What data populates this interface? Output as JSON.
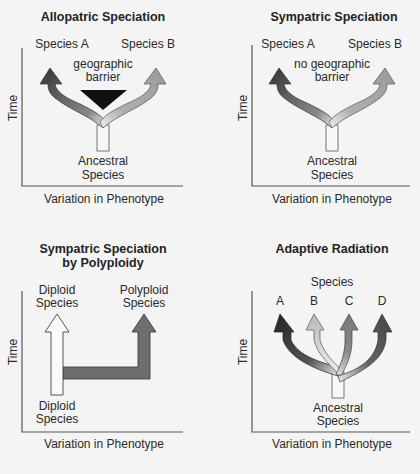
{
  "panels": {
    "allopatric": {
      "title": "Allopatric Speciation",
      "species_a": "Species A",
      "species_b": "Species B",
      "barrier_line1": "geographic",
      "barrier_line2": "barrier",
      "ancestral_line1": "Ancestral",
      "ancestral_line2": "Species",
      "y_axis": "Time",
      "x_axis": "Variation in Phenotype"
    },
    "sympatric": {
      "title": "Sympatric Speciation",
      "species_a": "Species A",
      "species_b": "Species B",
      "barrier_line1": "no geographic",
      "barrier_line2": "barrier",
      "ancestral_line1": "Ancestral",
      "ancestral_line2": "Species",
      "y_axis": "Time",
      "x_axis": "Variation in Phenotype"
    },
    "polyploidy": {
      "title_line1": "Sympatric Speciation",
      "title_line2": "by Polyploidy",
      "top_left_line1": "Diploid",
      "top_left_line2": "Species",
      "top_right_line1": "Polyploid",
      "top_right_line2": "Species",
      "bottom_line1": "Diploid",
      "bottom_line2": "Species",
      "y_axis": "Time",
      "x_axis": "Variation in Phenotype"
    },
    "adaptive": {
      "title": "Adaptive Radiation",
      "species_header": "Species",
      "species_labels": [
        "A",
        "B",
        "C",
        "D"
      ],
      "ancestral_line1": "Ancestral",
      "ancestral_line2": "Species",
      "y_axis": "Time",
      "x_axis": "Variation in Phenotype"
    }
  },
  "colors": {
    "background": "#f4f4f4",
    "dark_arrow": "#3a3a3a",
    "light_arrow": "#a9a9a9",
    "mid_arrow": "#7c7c7c",
    "barrier": "#111111",
    "polyploid_arrow": "#6e6e6e"
  }
}
